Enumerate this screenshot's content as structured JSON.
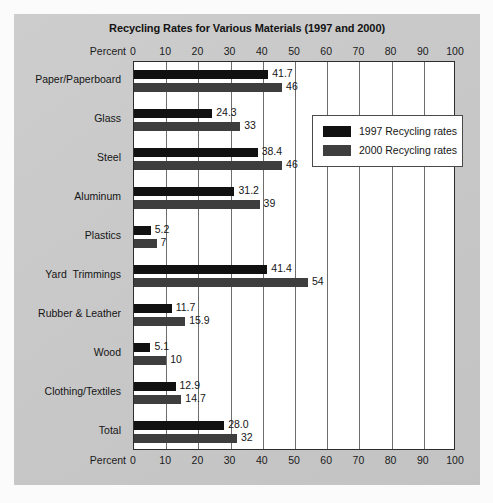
{
  "chart_data": {
    "type": "bar",
    "orientation": "horizontal",
    "title": "Recycling Rates for Various Materials (1997 and 2000)",
    "xlabel": "Percent",
    "ylabel": "",
    "xlim": [
      0,
      100
    ],
    "xticks": [
      0,
      10,
      20,
      30,
      40,
      50,
      60,
      70,
      80,
      90,
      100
    ],
    "xtick_labels": [
      "0",
      "10",
      "20",
      "30",
      "40",
      "50",
      "60",
      "70",
      "80",
      "90",
      "100"
    ],
    "grid": true,
    "grid_axis": "x",
    "axis_top": true,
    "axis_bottom": true,
    "legend_position": "upper right inside plot",
    "categories": [
      "Paper/Paperboard",
      "Glass",
      "Steel",
      "Aluminum",
      "Plastics",
      "Yard  Trimmings",
      "Rubber & Leather",
      "Wood",
      "Clothing/Textiles",
      "Total"
    ],
    "series": [
      {
        "name": "1997 Recycling rates",
        "color": "#111111",
        "values": [
          41.7,
          24.3,
          38.4,
          31.2,
          5.2,
          41.4,
          11.7,
          5.1,
          12.9,
          28.0
        ],
        "value_labels": [
          "41.7",
          "24.3",
          "38.4",
          "31.2",
          "5.2",
          "41.4",
          "11.7",
          "5.1",
          "12.9",
          "28.0"
        ]
      },
      {
        "name": "2000 Recycling rates",
        "color": "#3e3e3e",
        "values": [
          46,
          33,
          46,
          39,
          7,
          54,
          15.9,
          10,
          14.7,
          32
        ],
        "value_labels": [
          "46",
          "33",
          "46",
          "39",
          "7",
          "54",
          "15.9",
          "10",
          "14.7",
          "32"
        ]
      }
    ]
  },
  "legend": {
    "items": [
      {
        "label": "1997 Recycling rates",
        "color": "#111111"
      },
      {
        "label": "2000 Recycling rates",
        "color": "#3e3e3e"
      }
    ]
  },
  "axis": {
    "top_name": "Percent",
    "bottom_name": "Percent"
  }
}
